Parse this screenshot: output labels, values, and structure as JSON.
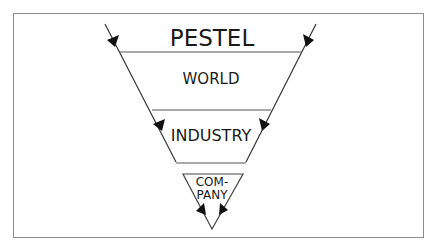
{
  "diagram": {
    "type": "funnel",
    "title": "PESTEL",
    "levels": [
      {
        "label": "WORLD"
      },
      {
        "label": "INDUSTRY"
      },
      {
        "label_line1": "COM-",
        "label_line2": "PANY"
      }
    ]
  },
  "colors": {
    "line": "#333333",
    "frame": "#8c8c8c",
    "text": "#1a1a1a",
    "background": "#ffffff"
  }
}
